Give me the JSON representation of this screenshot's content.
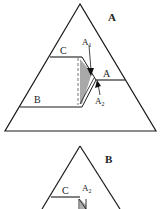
{
  "panels": [
    {
      "id": "A",
      "title": "A",
      "labels": {
        "c": "C",
        "a": "A",
        "b": "B",
        "a1_main": "A",
        "a1_sub": "1",
        "a2_main": "A",
        "a2_sub": "2"
      }
    },
    {
      "id": "B",
      "title": "B",
      "labels": {
        "c": "C",
        "a2_main": "A",
        "a2_sub": "2"
      }
    }
  ],
  "colors": {
    "line": "#1a1a1a",
    "shade": "#9a9a9a",
    "dashed": "#777777"
  }
}
